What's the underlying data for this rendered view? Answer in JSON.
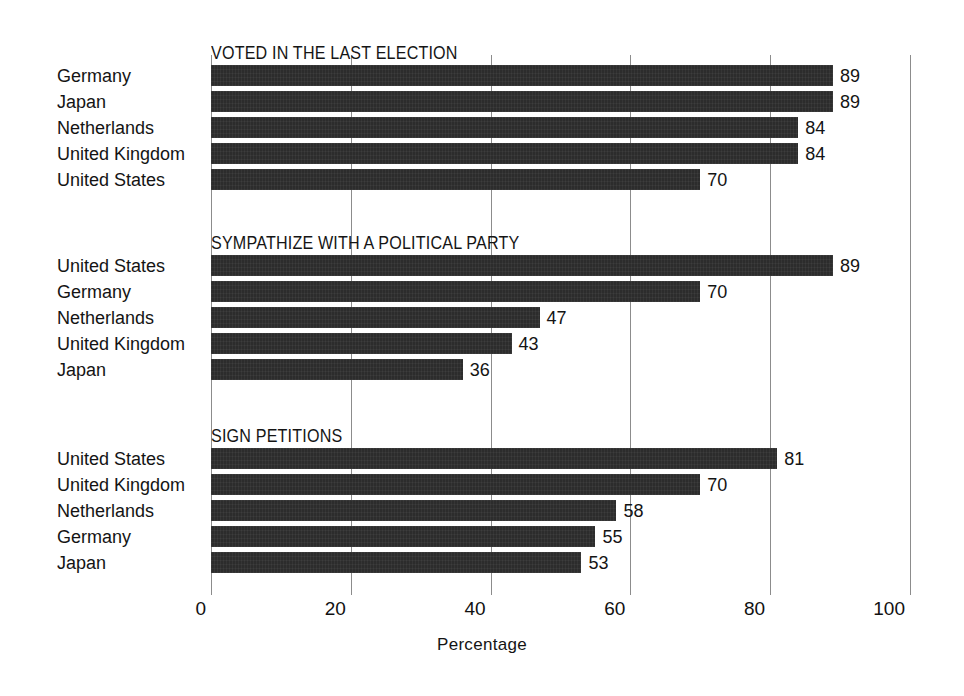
{
  "chart_data": {
    "type": "bar",
    "orientation": "horizontal",
    "title": "",
    "xlabel": "Percentage",
    "ylabel": "",
    "xlim": [
      0,
      100
    ],
    "xticks": [
      0,
      20,
      40,
      60,
      80,
      100
    ],
    "xtick_labels": [
      "0",
      "20",
      "40",
      "60",
      "80",
      "100"
    ],
    "grid": true,
    "legend": null,
    "bar_color": "#2c2c2c",
    "panels": [
      {
        "title": "VOTED IN THE LAST ELECTION",
        "categories": [
          "Germany",
          "Japan",
          "Netherlands",
          "United Kingdom",
          "United States"
        ],
        "values": [
          89,
          89,
          84,
          84,
          70
        ],
        "value_labels": [
          "89",
          "89",
          "84",
          "84",
          "70"
        ]
      },
      {
        "title": "SYMPATHIZE WITH A POLITICAL PARTY",
        "categories": [
          "United States",
          "Germany",
          "Netherlands",
          "United Kingdom",
          "Japan"
        ],
        "values": [
          89,
          70,
          47,
          43,
          36
        ],
        "value_labels": [
          "89",
          "70",
          "47",
          "43",
          "36"
        ]
      },
      {
        "title": "SIGN PETITIONS",
        "categories": [
          "United States",
          "United Kingdom",
          "Netherlands",
          "Germany",
          "Japan"
        ],
        "values": [
          81,
          70,
          58,
          55,
          53
        ],
        "value_labels": [
          "81",
          "70",
          "58",
          "55",
          "53"
        ]
      }
    ]
  }
}
